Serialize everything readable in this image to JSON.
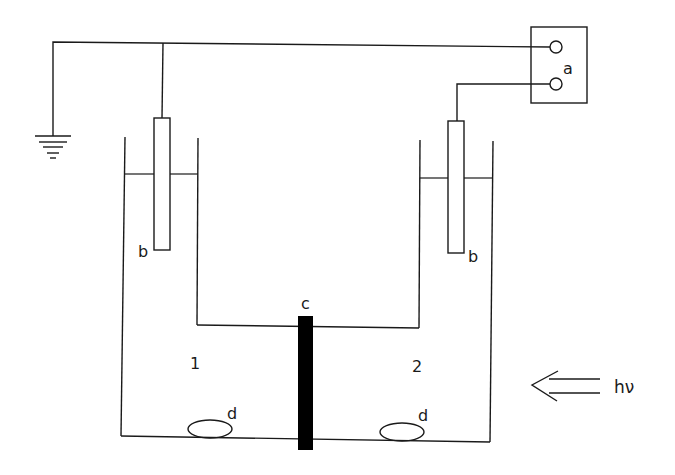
{
  "diagram": {
    "type": "photoelectrochemical two-compartment cell schematic",
    "colors": {
      "stroke": "#1a1a1a",
      "membrane": "#000000",
      "background": "#ffffff"
    },
    "labels": {
      "a": "a",
      "b_left": "b",
      "b_right": "b",
      "c": "c",
      "d_left": "d",
      "d_right": "d",
      "compartment_1": "1",
      "compartment_2": "2",
      "light": "hν"
    },
    "components": [
      {
        "id": "a",
        "description": "measuring instrument with two terminals"
      },
      {
        "id": "b",
        "description": "electrodes (one per compartment)"
      },
      {
        "id": "c",
        "description": "separating membrane between compartments"
      },
      {
        "id": "d",
        "description": "stir bars at compartment bottoms"
      },
      {
        "id": "ground",
        "description": "ground connection"
      },
      {
        "id": "hν",
        "description": "incident light direction (from right)"
      }
    ]
  }
}
